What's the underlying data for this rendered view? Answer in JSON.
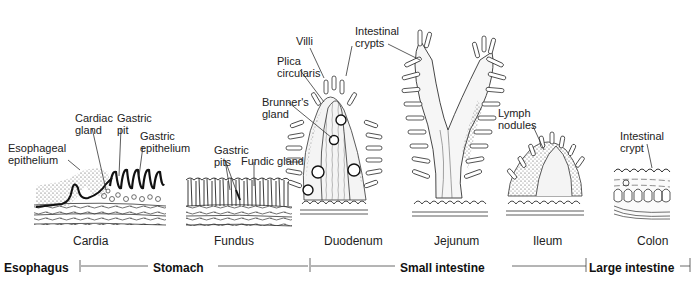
{
  "figure": {
    "sections": [
      {
        "name": "Cardia",
        "labels": [
          "Esophageal epithelium",
          "Cardiac gland",
          "Gastric pit",
          "Gastric epithelium"
        ]
      },
      {
        "name": "Fundus",
        "labels": [
          "Gastric pits",
          "Fundic gland"
        ]
      },
      {
        "name": "Duodenum",
        "labels": [
          "Villi",
          "Plica circularis",
          "Brunner's gland",
          "Intestinal crypts"
        ]
      },
      {
        "name": "Jejunum",
        "labels": []
      },
      {
        "name": "Ileum",
        "labels": [
          "Lymph nodules"
        ]
      },
      {
        "name": "Colon",
        "labels": [
          "Intestinal crypt"
        ]
      }
    ],
    "annotations": {
      "esophageal_1": "Esophageal",
      "esophageal_2": "epithelium",
      "cardiac_1": "Cardiac",
      "cardiac_2": "gland",
      "gpit_1": "Gastric",
      "gpit_2": "pit",
      "gepi_1": "Gastric",
      "gepi_2": "epithelium",
      "gpits_1": "Gastric",
      "gpits_2": "pits",
      "fundic": "Fundic gland",
      "villi": "Villi",
      "plica_1": "Plica",
      "plica_2": "circularis",
      "brunner_1": "Brunner's",
      "brunner_2": "gland",
      "crypts_1": "Intestinal",
      "crypts_2": "crypts",
      "lymph_1": "Lymph",
      "lymph_2": "nodules",
      "crypt_1": "Intestinal",
      "crypt_2": "crypt"
    },
    "section_names": {
      "cardia": "Cardia",
      "fundus": "Fundus",
      "duodenum": "Duodenum",
      "jejunum": "Jejunum",
      "ileum": "Ileum",
      "colon": "Colon"
    },
    "regions": {
      "esophagus": "Esophagus",
      "stomach": "Stomach",
      "small_intestine": "Small intestine",
      "large_intestine": "Large intestine"
    }
  }
}
